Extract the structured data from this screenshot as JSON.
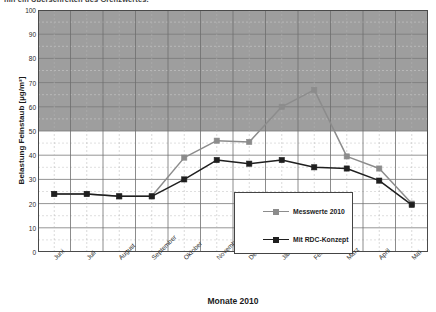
{
  "top_text": "hin ein Überschreiten des Grenzwertes.",
  "chart_data": {
    "type": "line",
    "title": "",
    "xlabel": "Monate 2010",
    "ylabel": "Belastung Feinstaub [µg/m³]",
    "categories": [
      "Juni",
      "Juli",
      "August",
      "September",
      "Oktober",
      "November",
      "Dezember",
      "Jänner",
      "Februar",
      "März",
      "April",
      "Mai"
    ],
    "series": [
      {
        "name": "Messwerte 2010",
        "color": "#8c8c8c",
        "values": [
          24,
          24,
          23,
          23,
          39,
          46,
          45.5,
          60,
          67,
          39.5,
          34.5,
          20
        ]
      },
      {
        "name": "Mit RDC-Konzept",
        "color": "#1f1f1f",
        "values": [
          24,
          24,
          23,
          23,
          30,
          38,
          36.5,
          38,
          35,
          34.5,
          29.5,
          19.5
        ]
      }
    ],
    "ylim": [
      0,
      100
    ],
    "yticks": [
      0,
      10,
      20,
      30,
      40,
      50,
      60,
      70,
      80,
      90,
      100
    ],
    "ytick_labels": [
      "0",
      "10",
      "20",
      "30",
      "40",
      "50",
      "60",
      "70",
      "80",
      "90",
      "100"
    ],
    "minor_y_step": 5,
    "grid": true,
    "legend_position": "inside-right",
    "shaded_band": {
      "from": 50,
      "to": 100,
      "color": "#9e9e9e",
      "label": "Grenzwertbereich"
    },
    "limit_line": 50
  },
  "legend": {
    "items": [
      {
        "label": "Messwerte 2010",
        "color": "#8c8c8c"
      },
      {
        "label": "Mit RDC-Konzept",
        "color": "#1f1f1f"
      }
    ]
  }
}
